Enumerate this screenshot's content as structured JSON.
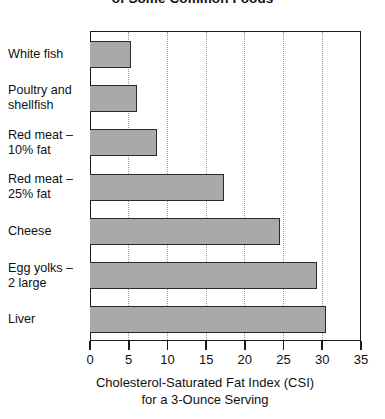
{
  "chart_data": {
    "type": "bar",
    "orientation": "horizontal",
    "title": "of Some Common Foods",
    "xlabel_line1": "Cholesterol-Saturated Fat Index (CSI)",
    "xlabel_line2": "for a 3-Ounce Serving",
    "ylabel": "",
    "xlim": [
      0,
      35
    ],
    "xticks": [
      0,
      5,
      10,
      15,
      20,
      25,
      30,
      35
    ],
    "grid": "vertical-dotted",
    "legend": "none",
    "bar_color": "#a9a9a9",
    "bar_edge_color": "#2a2a2a",
    "categories": [
      "White fish",
      "Poultry and shellfish",
      "Red meat – 10% fat",
      "Red meat – 25% fat",
      "Cheese",
      "Egg yolks – 2 large",
      "Liver"
    ],
    "category_label_lines": [
      [
        "White fish"
      ],
      [
        "Poultry and",
        "shellfish"
      ],
      [
        "Red meat  –",
        "10% fat"
      ],
      [
        "Red meat –",
        "25% fat"
      ],
      [
        "Cheese"
      ],
      [
        "Egg yolks –",
        "2 large"
      ],
      [
        "Liver"
      ]
    ],
    "values": [
      5.3,
      6.1,
      8.7,
      17.3,
      24.5,
      29.3,
      30.5
    ]
  }
}
